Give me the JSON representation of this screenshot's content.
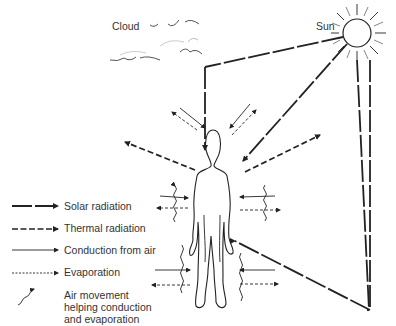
{
  "title_labels": {
    "cloud": "Cloud",
    "sun": "Sun"
  },
  "legend": {
    "items": [
      {
        "key": "solar",
        "label": "Solar radiation",
        "line_style": "long-dash",
        "icon": "long-dash-arrow-icon"
      },
      {
        "key": "thermal",
        "label": "Thermal radiation",
        "line_style": "short-dash",
        "icon": "short-dash-arrow-icon"
      },
      {
        "key": "conduction",
        "label": "Conduction from air",
        "line_style": "thin-solid",
        "icon": "thin-arrow-icon"
      },
      {
        "key": "evaporation",
        "label": "Evaporation",
        "line_style": "dotted",
        "icon": "dotted-arrow-icon"
      },
      {
        "key": "air_movement",
        "label": "Air movement helping conduction and evaporation",
        "line_style": "wavy",
        "icon": "wavy-arrow-icon"
      }
    ],
    "air_movement_lines": [
      "Air movement",
      "helping conduction",
      "and evaporation"
    ]
  },
  "colors": {
    "ink": "#222222",
    "background": "#ffffff"
  }
}
